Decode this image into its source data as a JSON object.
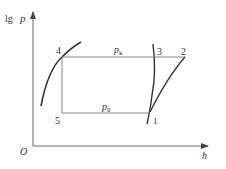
{
  "diagram": {
    "type": "lgp-h refrigeration cycle diagram",
    "axes": {
      "y_label_prefix": "lg",
      "y_label_var": "p",
      "x_label": "h",
      "origin_label": "O"
    },
    "points": [
      {
        "id": "1",
        "label": "1"
      },
      {
        "id": "2",
        "label": "2"
      },
      {
        "id": "3",
        "label": "3"
      },
      {
        "id": "4",
        "label": "4"
      },
      {
        "id": "5",
        "label": "5"
      }
    ],
    "isobars": {
      "condensing": {
        "var": "p",
        "sub": "k"
      },
      "evaporating": {
        "var": "p",
        "sub": "0"
      }
    },
    "colors": {
      "line": "#555555",
      "curve": "#333333",
      "text": "#333333"
    }
  }
}
